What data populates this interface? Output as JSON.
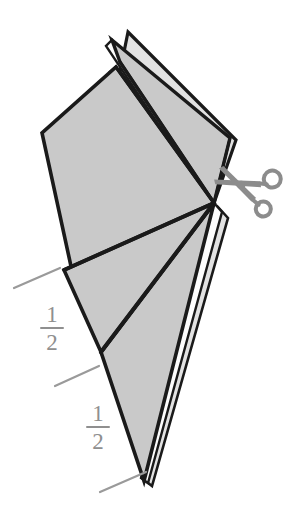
{
  "figure": {
    "background_color": "#ffffff",
    "paper_fill_color": "#c9c9c9",
    "paper_light_color": "#e2e2e2",
    "paper_edge_color": "#1a1a1a",
    "label_color": "#8f8f8f",
    "tick_color": "#9a9a9a",
    "scissors_color": "#8c8c8c"
  },
  "labels": {
    "fraction_upper": {
      "name": "one-half-upper",
      "numerator": "1",
      "denominator": "2"
    },
    "fraction_lower": {
      "name": "one-half-lower",
      "numerator": "1",
      "denominator": "2"
    }
  },
  "icons": {
    "scissors": "scissors-icon"
  },
  "tick_marks": [
    {
      "name": "tick-top",
      "x1": 14,
      "y1": 288,
      "x2": 60,
      "y2": 268
    },
    {
      "name": "tick-middle",
      "x1": 55,
      "y1": 386,
      "x2": 99,
      "y2": 366
    },
    {
      "name": "tick-bottom",
      "x1": 100,
      "y1": 492,
      "x2": 146,
      "y2": 472
    }
  ]
}
